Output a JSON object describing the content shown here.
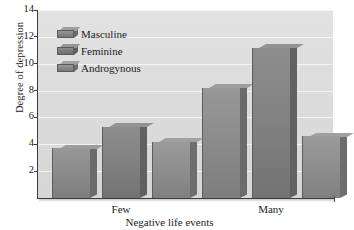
{
  "chart_data": {
    "type": "bar",
    "title": "",
    "subtitle": "",
    "xlabel": "Negative life events",
    "ylabel": "Degree of depression",
    "categories": [
      "Few",
      "Many"
    ],
    "series": [
      {
        "name": "Masculine",
        "values": [
          3.7,
          8.2
        ],
        "color": "#8d8d8d"
      },
      {
        "name": "Feminine",
        "values": [
          5.3,
          11.2
        ],
        "color": "#838383"
      },
      {
        "name": "Androgynous",
        "values": [
          4.2,
          4.6
        ],
        "color": "#909090"
      }
    ],
    "ylim": [
      0,
      14
    ],
    "yticks": [
      2,
      4,
      6,
      8,
      10,
      12,
      14
    ],
    "ytick_labels": [
      "2",
      "4",
      "6",
      "8",
      "10",
      "12",
      "14"
    ],
    "grid": true,
    "grid_axis": "y",
    "legend_position": "upper left",
    "plot_background": "#dcdcdc",
    "grid_color": "#f4f4f4",
    "axis_color": "#3c3c3c",
    "style": "3d-bars-grayscale"
  },
  "legend": {
    "items": [
      {
        "label": "Masculine"
      },
      {
        "label": "Feminine"
      },
      {
        "label": "Androgynous"
      }
    ]
  }
}
